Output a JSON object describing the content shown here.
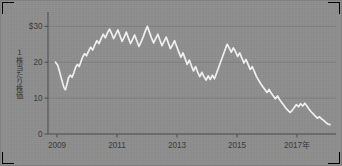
{
  "figure": {
    "background_color": "#8e8e8e",
    "line_color": "#f2f2f2",
    "axis_color": "#4a4a4a",
    "grid_color": "#7a7a7a",
    "text_color": "#333333"
  },
  "axis_label_vertical": "1株当たり株価",
  "chart_data": {
    "type": "line",
    "title": "",
    "subtitle": "",
    "xlabel": "2017年",
    "ylabel": "1株当たり株価",
    "grid": true,
    "legend": "none",
    "xlim": [
      2008.7,
      2018.3
    ],
    "ylim": [
      0,
      34
    ],
    "ytick_labels": [
      "$30",
      "20",
      "10",
      "0"
    ],
    "yticks": [
      30,
      20,
      10,
      0
    ],
    "xtick_labels": [
      "2009",
      "2011",
      "2013",
      "2015",
      "2017年"
    ],
    "xticks": [
      2009,
      2011,
      2013,
      2015,
      2017
    ],
    "series": [
      {
        "name": "1株当たり株価",
        "x": [
          2008.95,
          2009.02,
          2009.08,
          2009.13,
          2009.18,
          2009.23,
          2009.28,
          2009.33,
          2009.38,
          2009.44,
          2009.5,
          2009.56,
          2009.62,
          2009.68,
          2009.74,
          2009.8,
          2009.86,
          2009.92,
          2009.98,
          2010.05,
          2010.12,
          2010.19,
          2010.26,
          2010.33,
          2010.4,
          2010.47,
          2010.54,
          2010.61,
          2010.68,
          2010.75,
          2010.82,
          2010.89,
          2010.96,
          2011.03,
          2011.1,
          2011.17,
          2011.24,
          2011.31,
          2011.38,
          2011.45,
          2011.52,
          2011.59,
          2011.66,
          2011.73,
          2011.8,
          2011.87,
          2011.94,
          2012.01,
          2012.08,
          2012.15,
          2012.22,
          2012.29,
          2012.36,
          2012.43,
          2012.5,
          2012.57,
          2012.64,
          2012.71,
          2012.78,
          2012.85,
          2012.92,
          2012.99,
          2013.06,
          2013.13,
          2013.2,
          2013.27,
          2013.34,
          2013.41,
          2013.48,
          2013.55,
          2013.62,
          2013.69,
          2013.76,
          2013.83,
          2013.9,
          2013.97,
          2014.04,
          2014.11,
          2014.18,
          2014.25,
          2014.32,
          2014.39,
          2014.46,
          2014.53,
          2014.6,
          2014.67,
          2014.74,
          2014.81,
          2014.88,
          2014.95,
          2015.02,
          2015.09,
          2015.16,
          2015.23,
          2015.3,
          2015.37,
          2015.44,
          2015.51,
          2015.58,
          2015.65,
          2015.72,
          2015.79,
          2015.86,
          2015.93,
          2016.0,
          2016.07,
          2016.14,
          2016.21,
          2016.28,
          2016.35,
          2016.42,
          2016.49,
          2016.56,
          2016.63,
          2016.7,
          2016.77,
          2016.84,
          2016.91,
          2016.98,
          2017.05,
          2017.12,
          2017.19,
          2017.26,
          2017.33,
          2017.4,
          2017.47,
          2017.54,
          2017.61,
          2017.68,
          2017.75,
          2017.82,
          2017.89,
          2017.96,
          2018.03,
          2018.1
        ],
        "values": [
          20.0,
          19.2,
          17.6,
          16.0,
          14.4,
          13.0,
          12.3,
          13.8,
          15.6,
          16.4,
          15.8,
          17.0,
          18.6,
          19.4,
          18.8,
          20.2,
          21.6,
          22.4,
          21.8,
          23.0,
          24.2,
          23.4,
          24.8,
          26.0,
          25.2,
          26.6,
          27.8,
          26.8,
          28.2,
          29.2,
          28.0,
          26.6,
          27.8,
          29.0,
          27.4,
          25.8,
          27.0,
          28.4,
          26.8,
          25.2,
          26.4,
          27.6,
          26.0,
          24.4,
          25.6,
          27.0,
          28.6,
          30.0,
          28.4,
          26.8,
          25.4,
          26.6,
          27.8,
          26.2,
          24.6,
          25.8,
          27.0,
          25.4,
          23.8,
          24.8,
          26.0,
          24.4,
          22.8,
          21.4,
          22.6,
          21.0,
          19.4,
          20.6,
          19.0,
          17.6,
          18.8,
          17.2,
          16.0,
          17.2,
          16.0,
          15.0,
          16.2,
          15.2,
          16.4,
          15.4,
          17.0,
          18.6,
          20.2,
          21.8,
          23.4,
          25.0,
          24.0,
          22.8,
          24.0,
          23.0,
          21.6,
          22.6,
          21.2,
          19.8,
          20.8,
          19.4,
          18.0,
          18.8,
          17.4,
          16.0,
          15.0,
          14.0,
          13.2,
          12.4,
          11.6,
          12.4,
          11.4,
          10.6,
          9.8,
          10.6,
          9.6,
          8.8,
          8.0,
          7.2,
          6.6,
          6.0,
          6.6,
          7.4,
          8.2,
          7.6,
          8.4,
          7.8,
          8.6,
          7.8,
          7.0,
          6.2,
          5.6,
          5.0,
          4.4,
          4.8,
          4.2,
          3.8,
          3.2,
          2.8,
          2.6
        ]
      }
    ]
  }
}
